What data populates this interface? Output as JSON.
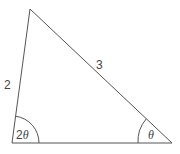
{
  "diagram": {
    "type": "triangle",
    "colors": {
      "stroke": "#555555",
      "text": "#444444",
      "background": "#ffffff"
    },
    "vertices": {
      "top": [
        30,
        9
      ],
      "bottom_left": [
        12,
        143
      ],
      "bottom_right": [
        172,
        143
      ]
    },
    "sides": {
      "left": {
        "label": "2"
      },
      "hypotenuse": {
        "label": "3"
      },
      "base": {
        "label": ""
      }
    },
    "angles": {
      "bottom_left": {
        "label_num": "2",
        "label_sym": "θ"
      },
      "bottom_right": {
        "label_sym": "θ"
      }
    }
  }
}
